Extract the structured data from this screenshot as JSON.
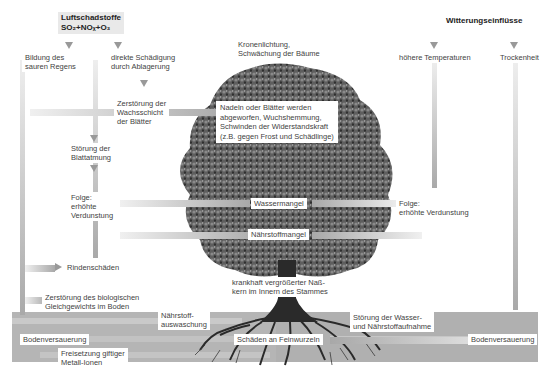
{
  "sources": {
    "pollutants_title": "Luftschadstoffe",
    "pollutants_formula": "SO₂+NOₓ+O₃",
    "weather_title": "Witterungseinflüsse"
  },
  "left_chain": {
    "acid_rain": "Bildung des sauren Regens",
    "acid_rain_l1": "Bildung des",
    "acid_rain_l2": "sauren Regens",
    "direct_damage_l1": "direkte Schädigung",
    "direct_damage_l2": "durch Ablagerung",
    "wax_l1": "Zerstörung der",
    "wax_l2": "Wachsschicht",
    "wax_l3": "der Blätter",
    "respiration_l1": "Störung der",
    "respiration_l2": "Blattatmung",
    "evap_l1": "Folge:",
    "evap_l2": "erhöhte",
    "evap_l3": "Verdunstung",
    "bark": "Rindenschäden",
    "bio_l1": "Zerstörung des biologischen",
    "bio_l2": "Gleichgewichts im Boden"
  },
  "center": {
    "crown_l1": "Kronenlichtung,",
    "crown_l2": "Schwächung der Bäume",
    "needles_l1": "Nadeln oder Blätter werden",
    "needles_l2": "abgeworfen, Wuchshemmung,",
    "needles_l3": "Schwinden der Widerstandskraft",
    "needles_l4": "(z.B. gegen Frost und Schädlinge)",
    "water_shortage": "Wassermangel",
    "nutrient_shortage": "Nährstoffmangel",
    "trunk_l1": "krankhaft vergrößerter Naß-",
    "trunk_l2": "kern im Innern des Stammes"
  },
  "right_chain": {
    "higher_temp": "höhere Temperaturen",
    "drought": "Trockenheit",
    "evap_l1": "Folge:",
    "evap_l2": "erhöhte Verdunstung"
  },
  "soil": {
    "acidification_left": "Bodenversauerung",
    "leaching_l1": "Nährstoff-",
    "leaching_l2": "auswaschung",
    "metals_l1": "Freisetzung giftiger",
    "metals_l2": "Metall-Ionen",
    "fine_roots": "Schäden an Feinwurzeln",
    "uptake_l1": "Störung der Wasser-",
    "uptake_l2": "und Nährstoffaufnahme",
    "acidification_right": "Bodenversauerung"
  },
  "colors": {
    "arrow_gray": "#a8a8a8",
    "soil_gray": "#b5b5b5",
    "tree_green_dark": "#4b4b4b",
    "background": "#ffffff"
  }
}
